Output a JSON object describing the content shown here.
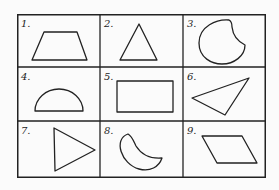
{
  "grid": {
    "rows": 3,
    "cols": 3,
    "cells": [
      {
        "label": "1.",
        "shape": "trapezoid"
      },
      {
        "label": "2.",
        "shape": "triangle"
      },
      {
        "label": "3.",
        "shape": "circle-with-notch"
      },
      {
        "label": "4.",
        "shape": "semicircle"
      },
      {
        "label": "5.",
        "shape": "rectangle"
      },
      {
        "label": "6.",
        "shape": "scalene-triangle"
      },
      {
        "label": "7.",
        "shape": "right-pointing-triangle"
      },
      {
        "label": "8.",
        "shape": "crescent-leaf"
      },
      {
        "label": "9.",
        "shape": "parallelogram"
      }
    ]
  },
  "colors": {
    "line": "#222222",
    "background": "#fbfbfb"
  }
}
